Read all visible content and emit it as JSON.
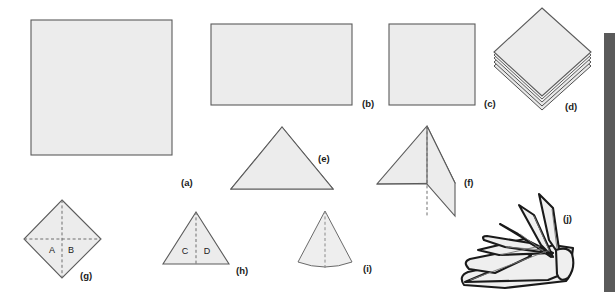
{
  "figure": {
    "background_color": "#ffffff",
    "paper_fill": "#ececec",
    "paper_stroke": "#5b5b5b",
    "crane_stroke": "#1a1a1a",
    "side_band_color": "#5a5a5a",
    "panel_labels": {
      "a": "(a)",
      "b": "(b)",
      "c": "(c)",
      "d": "(d)",
      "e": "(e)",
      "f": "(f)",
      "g": "(g)",
      "h": "(h)",
      "i": "(i)",
      "j": "(j)"
    },
    "region_labels": {
      "A": "A",
      "B": "B",
      "C": "C",
      "D": "D"
    },
    "panels": [
      {
        "id": "a",
        "label": "(a)",
        "shape": "square-sheet",
        "row": 1
      },
      {
        "id": "b",
        "label": "(b)",
        "shape": "wide-rectangle",
        "row": 1
      },
      {
        "id": "c",
        "label": "(c)",
        "shape": "small-square",
        "row": 1
      },
      {
        "id": "d",
        "label": "(d)",
        "shape": "layered-diamond",
        "row": 1
      },
      {
        "id": "e",
        "label": "(e)",
        "shape": "layered-triangle",
        "row": 2
      },
      {
        "id": "f",
        "label": "(f)",
        "shape": "triangle-with-flap",
        "row": 2
      },
      {
        "id": "g",
        "label": "(g)",
        "shape": "kite-with-cross-fold",
        "row": 3
      },
      {
        "id": "h",
        "label": "(h)",
        "shape": "triangle-with-center-fold",
        "row": 3
      },
      {
        "id": "i",
        "label": "(i)",
        "shape": "cone",
        "row": 3
      },
      {
        "id": "j",
        "label": "(j)",
        "shape": "folded-origami-crane",
        "row": 3
      }
    ]
  }
}
